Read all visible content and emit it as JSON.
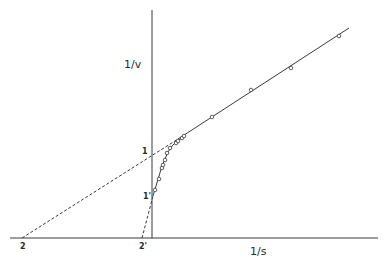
{
  "chart_data": {
    "type": "line",
    "title": "",
    "xlabel": "1/s",
    "ylabel": "1/v",
    "grid": false,
    "legend": null,
    "colors": {
      "ink": "#3a3a3a",
      "background": "#ffffff"
    },
    "axes": {
      "x_axis": {
        "x1": 10,
        "x2": 378,
        "y": 238
      },
      "y_axis": {
        "x": 152,
        "y1": 10,
        "y2": 238
      }
    },
    "intercept_labels": {
      "x_intercept_a": {
        "text": "2",
        "px": 23,
        "py": 247
      },
      "x_intercept_b": {
        "text": "2'",
        "px": 142,
        "py": 247
      },
      "y_intercept_a": {
        "text": "1",
        "px": 145,
        "py": 152
      },
      "y_intercept_b": {
        "text": "1'",
        "px": 146,
        "py": 197
      }
    },
    "series": [
      {
        "name": "linear-fit-high",
        "style": "solid",
        "points_px": [
          [
            178,
            139
          ],
          [
            349,
            28
          ]
        ]
      },
      {
        "name": "curved-fit-low",
        "style": "solid",
        "points_px": [
          [
            153,
            196
          ],
          [
            156,
            186
          ],
          [
            159,
            176
          ],
          [
            162,
            166
          ],
          [
            165,
            159
          ],
          [
            168,
            152
          ],
          [
            172,
            146
          ],
          [
            177,
            141
          ],
          [
            182,
            138
          ]
        ]
      },
      {
        "name": "extrapolation-1",
        "style": "dashed",
        "points_px": [
          [
            22,
            238
          ],
          [
            178,
            139
          ]
        ]
      },
      {
        "name": "extrapolation-2",
        "style": "dashed",
        "points_px": [
          [
            142,
            238
          ],
          [
            153,
            196
          ]
        ]
      },
      {
        "name": "observations",
        "style": "markers",
        "points_px": [
          [
            155,
            190
          ],
          [
            159,
            179
          ],
          [
            162,
            168
          ],
          [
            163,
            165
          ],
          [
            165,
            160
          ],
          [
            167,
            153
          ],
          [
            170,
            148
          ],
          [
            176,
            143
          ],
          [
            178,
            141
          ],
          [
            182,
            138
          ],
          [
            184,
            136
          ],
          [
            212,
            117
          ],
          [
            251,
            90
          ],
          [
            291,
            68
          ],
          [
            339,
            36
          ]
        ]
      }
    ]
  }
}
